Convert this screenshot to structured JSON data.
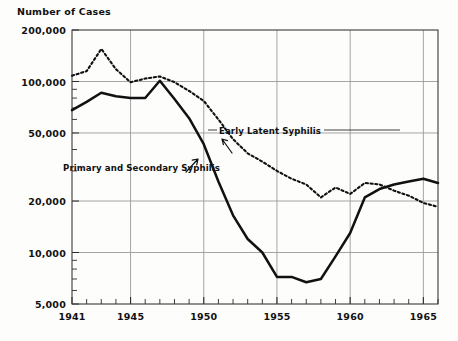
{
  "chart_data": {
    "type": "line",
    "title": "Number of Cases",
    "xlabel": "",
    "ylabel": "Number of Cases",
    "yscale": "log",
    "ylim": [
      5000,
      200000
    ],
    "xlim": [
      1941,
      1966
    ],
    "grid": true,
    "legend_position": "inline-annotations",
    "ytick_labels": [
      "200,000",
      "100,000",
      "50,000",
      "20,000",
      "10,000",
      "5,000"
    ],
    "ytick_values": [
      200000,
      100000,
      50000,
      20000,
      10000,
      5000
    ],
    "xtick_labels": [
      "1941",
      "1945",
      "1950",
      "1955",
      "1960",
      "1965"
    ],
    "xtick_values": [
      1941,
      1945,
      1950,
      1955,
      1960,
      1965
    ],
    "x": [
      1941,
      1942,
      1943,
      1944,
      1945,
      1946,
      1947,
      1948,
      1949,
      1950,
      1951,
      1952,
      1953,
      1954,
      1955,
      1956,
      1957,
      1958,
      1959,
      1960,
      1961,
      1962,
      1963,
      1964,
      1965,
      1966
    ],
    "series": [
      {
        "name": "Early Latent Syphilis",
        "style": "dotted",
        "color": "#111111",
        "values": [
          108000,
          115000,
          155000,
          118000,
          99000,
          104000,
          107000,
          99000,
          88000,
          77000,
          60000,
          46000,
          38000,
          34000,
          30000,
          27000,
          25000,
          21000,
          24000,
          22000,
          25500,
          25000,
          23000,
          21500,
          19500,
          18500
        ]
      },
      {
        "name": "Primary and Secondary Syphilis",
        "style": "solid",
        "color": "#111111",
        "values": [
          68000,
          76000,
          86000,
          82000,
          80000,
          80000,
          101000,
          79000,
          61000,
          43000,
          26000,
          16500,
          12000,
          10000,
          7200,
          7200,
          6700,
          7000,
          9500,
          13000,
          21000,
          23500,
          25000,
          26000,
          27000,
          25500
        ]
      }
    ],
    "annotations": [
      {
        "id": "early-latent-syphilis",
        "text": "Early Latent Syphilis",
        "leader": "horizontal-line-right",
        "arrow": "down-left"
      },
      {
        "id": "primary-and-secondary-syphilis",
        "text": "Primary and Secondary Syphilis",
        "leader": "none",
        "arrow": "up-right"
      }
    ]
  }
}
